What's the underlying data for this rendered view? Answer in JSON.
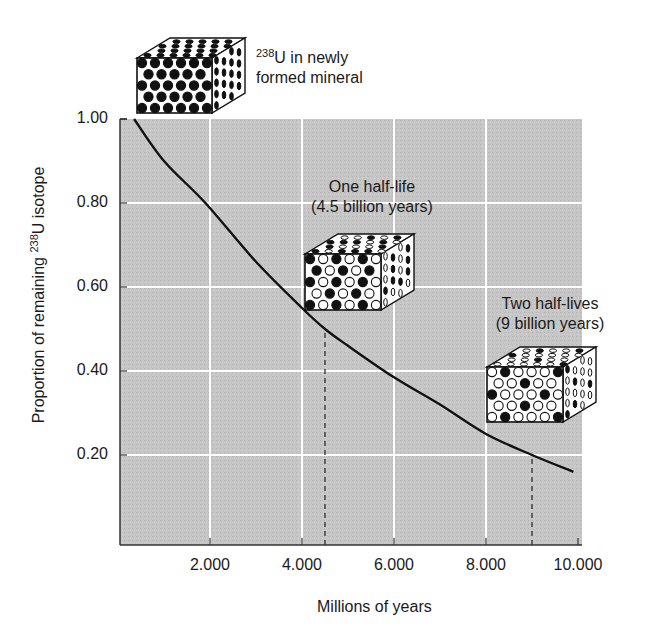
{
  "chart_data": {
    "type": "line",
    "title": "",
    "xlabel": "Millions of years",
    "ylabel_prefix": "Proportion of remaining ",
    "ylabel_sup": "238",
    "ylabel_suffix": "U isotope",
    "xlim": [
      0,
      10000
    ],
    "ylim": [
      0,
      1.0
    ],
    "grid": true,
    "x_ticks": [
      "2.000",
      "4.000",
      "6.000",
      "8.000",
      "10.000"
    ],
    "x_tick_values": [
      2000,
      4000,
      6000,
      8000,
      10000
    ],
    "y_ticks": [
      "1.00",
      "0.80",
      "0.60",
      "0.40",
      "0.20"
    ],
    "y_tick_values": [
      1.0,
      0.8,
      0.6,
      0.4,
      0.2
    ],
    "series": [
      {
        "name": "238U decay curve",
        "x": [
          350,
          1000,
          1900,
          3000,
          4000,
          4500,
          5000,
          6000,
          7000,
          8000,
          9000,
          9900
        ],
        "y": [
          1.0,
          0.9,
          0.8,
          0.66,
          0.55,
          0.5,
          0.46,
          0.385,
          0.32,
          0.25,
          0.2,
          0.16
        ]
      }
    ],
    "reference_lines": [
      {
        "x": 4500,
        "y": 0.5,
        "style": "dashed",
        "label": "One half-life"
      },
      {
        "x": 9000,
        "y": 0.2,
        "style": "dashed",
        "label": "Two half-lives"
      }
    ],
    "annotations": [
      {
        "id": "initial",
        "sup": "238",
        "line1": "U in newly",
        "line2": "formed mineral"
      },
      {
        "id": "one_half_life",
        "line1": "One half-life",
        "line2": "(4.5 billion years)"
      },
      {
        "id": "two_half_lives",
        "line1": "Two half-lives",
        "line2": "(9 billion years)"
      }
    ],
    "crystal_cubes": [
      {
        "id": "initial",
        "icon": "crystal-cube-icon",
        "rows": [
          "111111",
          "11111",
          "111111",
          "11111",
          "111111"
        ]
      },
      {
        "id": "one_half_life",
        "icon": "crystal-cube-icon",
        "rows": [
          "101010",
          "10101",
          "101010",
          "01010",
          "101010"
        ]
      },
      {
        "id": "two_half_lives",
        "icon": "crystal-cube-icon",
        "rows": [
          "010001",
          "00100",
          "100010",
          "00100",
          "010001"
        ]
      }
    ],
    "colors": {
      "plot_background": "#c4c4c4",
      "gridline": "#ffffff",
      "curve": "#111111",
      "filled_atom": "#111111",
      "empty_atom": "#ffffff"
    }
  }
}
